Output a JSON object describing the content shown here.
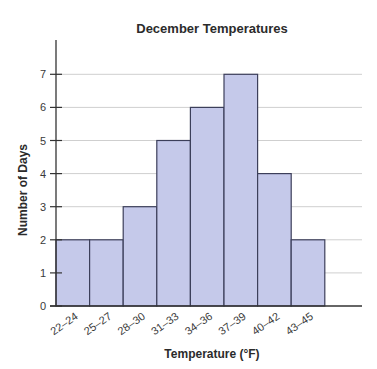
{
  "chart_data": {
    "type": "bar",
    "subtype": "histogram",
    "title": "December Temperatures",
    "xlabel": "Temperature (°F)",
    "ylabel": "Number of Days",
    "categories": [
      "22–24",
      "25–27",
      "28–30",
      "31–33",
      "34–36",
      "37–39",
      "40–42",
      "43–45"
    ],
    "values": [
      2,
      2,
      3,
      5,
      6,
      7,
      4,
      2
    ],
    "ylim": [
      0,
      7
    ],
    "yticks": [
      0,
      1,
      2,
      3,
      4,
      5,
      6,
      7
    ],
    "grid": "horizontal",
    "legend": null,
    "colors": {
      "bar_fill": "#c5c9ea",
      "bar_stroke": "#3c3f5a",
      "grid": "#cfcfcf",
      "axis": "#333333"
    }
  }
}
